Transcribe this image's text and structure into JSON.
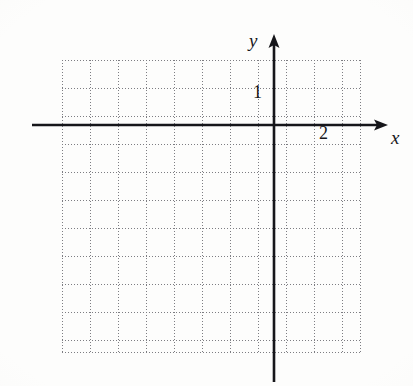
{
  "figure": {
    "width": 413,
    "height": 386,
    "background_color": "#fdfdfc"
  },
  "axes": {
    "x_axis_label": "x",
    "y_axis_label": "y",
    "axis_color": "#16161a",
    "origin_px": {
      "x": 274,
      "y": 125
    },
    "x_axis_start_px": 32,
    "x_axis_end_px": 388,
    "y_axis_top_px": 35,
    "y_axis_bottom_px": 382,
    "x_arrow": "arrow-right",
    "y_arrow": "arrow-up"
  },
  "tick_labels": [
    {
      "name": "y-tick-1",
      "text": "1",
      "axis": "y",
      "value": 1
    },
    {
      "name": "x-tick-2",
      "text": "2",
      "axis": "x",
      "value": 2
    }
  ],
  "grid": {
    "style": "dotted",
    "color": "#7d7d82",
    "cell_size_px": 28,
    "left_px": 62,
    "top_px": 60,
    "width_px": 298,
    "height_px": 292,
    "columns": 11,
    "rows": 11,
    "vertical_lines_px": [
      0,
      28,
      56,
      84,
      112,
      140,
      168,
      196,
      224,
      252,
      280,
      298
    ],
    "horizontal_lines_px": [
      0,
      28,
      56,
      84,
      112,
      140,
      168,
      196,
      224,
      252,
      280,
      292
    ]
  },
  "chart_data": {
    "type": "scatter",
    "title": "",
    "xlabel": "x",
    "ylabel": "y",
    "x": [],
    "y": [],
    "series": [],
    "grid": true,
    "legend": "none",
    "xlim": [
      -7.6,
      4.0
    ],
    "ylim": [
      -8.9,
      3.1
    ],
    "xticks": [
      2
    ],
    "yticks": [
      1
    ],
    "xticklabels": [
      "2"
    ],
    "yticklabels": [
      "1"
    ],
    "unit_px": 29,
    "annotations": []
  }
}
